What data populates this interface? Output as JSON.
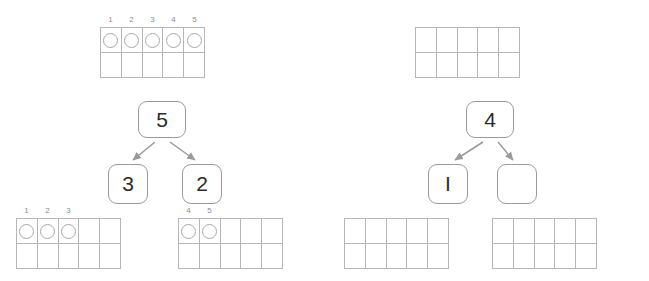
{
  "worksheet": {
    "title": "Number bond with ten-frames",
    "counter_icon": "circle-counter-icon",
    "arrow_icon": "arrow-down-icon",
    "colors": {
      "grid_line": "#b6b6b6",
      "counter_outline": "#a8a8a8",
      "box_outline": "#9a9a9a",
      "label_text": "#8d8d8d",
      "number_text": "#2b2b2b",
      "arrow": "#9a9a9a"
    },
    "left_group": {
      "top_frame": {
        "labels": [
          "1",
          "2",
          "3",
          "4",
          "5"
        ],
        "top_row_counters": [
          true,
          true,
          true,
          true,
          true,
          false,
          false,
          false,
          false,
          false
        ],
        "columns": 5,
        "rows": 2
      },
      "bond": {
        "whole": "5",
        "part_left": "3",
        "part_right": "2"
      },
      "bottom_left_frame": {
        "labels": [
          "1",
          "2",
          "3"
        ],
        "top_row_counters": [
          true,
          true,
          true,
          false,
          false
        ],
        "columns": 5,
        "rows": 2
      },
      "bottom_right_frame": {
        "labels": [
          "4",
          "5"
        ],
        "top_row_counters": [
          true,
          true,
          false,
          false,
          false
        ],
        "columns": 5,
        "rows": 2
      }
    },
    "right_group": {
      "top_frame": {
        "labels": [
          "",
          "",
          "",
          "",
          ""
        ],
        "top_row_counters": [
          false,
          false,
          false,
          false,
          false
        ],
        "columns": 5,
        "rows": 2
      },
      "bond": {
        "whole": "4",
        "part_left": "I",
        "part_right": ""
      },
      "bottom_left_frame": {
        "labels": [
          "",
          "",
          "",
          "",
          ""
        ],
        "top_row_counters": [
          false,
          false,
          false,
          false,
          false
        ],
        "columns": 5,
        "rows": 2
      },
      "bottom_right_frame": {
        "labels": [
          "",
          "",
          "",
          "",
          ""
        ],
        "top_row_counters": [
          false,
          false,
          false,
          false,
          false
        ],
        "columns": 5,
        "rows": 2
      }
    }
  }
}
